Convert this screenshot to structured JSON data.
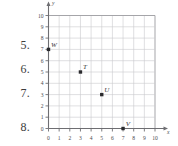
{
  "question_numbers": [
    {
      "label": "5.",
      "top": 38
    },
    {
      "label": "6.",
      "top": 62
    },
    {
      "label": "7.",
      "top": 86
    },
    {
      "label": "8.",
      "top": 120
    }
  ],
  "chart_data": {
    "type": "scatter",
    "title": "",
    "xlabel": "x",
    "ylabel": "y",
    "xlim": [
      0,
      10
    ],
    "ylim": [
      0,
      10
    ],
    "xticks": [
      "0",
      "1",
      "2",
      "3",
      "4",
      "5",
      "6",
      "7",
      "8",
      "9",
      "10"
    ],
    "yticks": [
      "0",
      "1",
      "2",
      "3",
      "4",
      "5",
      "6",
      "7",
      "8",
      "9",
      "10"
    ],
    "grid": true,
    "legend": "none",
    "points": [
      {
        "label": "W",
        "x": 0,
        "y": 7
      },
      {
        "label": "T",
        "x": 3,
        "y": 5
      },
      {
        "label": "U",
        "x": 5,
        "y": 3
      },
      {
        "label": "V",
        "x": 7,
        "y": 0
      }
    ],
    "marker_color": "#2b2b2e",
    "grid_color": "#c9c9cc",
    "axis_color": "#6e6e72"
  }
}
